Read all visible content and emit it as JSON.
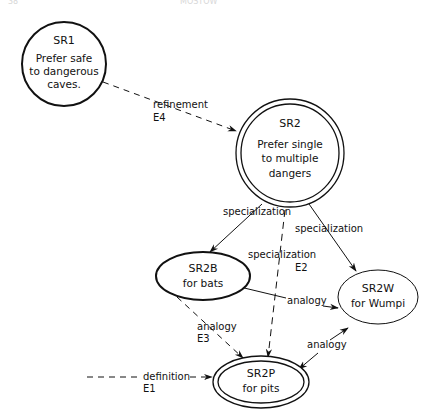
{
  "header": {
    "page_fragment": "38",
    "title_fragment": "MOSTOW"
  },
  "nodes": {
    "sr1": {
      "id": "SR1",
      "lines": [
        "Prefer safe",
        "to dangerous",
        "caves."
      ]
    },
    "sr2": {
      "id": "SR2",
      "lines": [
        "Prefer single",
        "to multiple",
        "dangers"
      ]
    },
    "sr2b": {
      "id": "SR2B",
      "lines": [
        "for bats"
      ]
    },
    "sr2w": {
      "id": "SR2W",
      "lines": [
        "for Wumpi"
      ]
    },
    "sr2p": {
      "id": "SR2P",
      "lines": [
        "for pits"
      ]
    }
  },
  "edges": {
    "sr1_sr2": {
      "label": "refinement",
      "event": "E4",
      "style": "dashed"
    },
    "sr2_sr2b": {
      "label": "specialization",
      "style": "solid"
    },
    "sr2_sr2w": {
      "label": "specialization",
      "style": "solid"
    },
    "sr2_sr2p": {
      "label": "specialization",
      "event": "E2",
      "style": "dashed"
    },
    "sr2b_sr2w": {
      "label": "analogy",
      "style": "solid-bidirectional"
    },
    "sr2b_sr2p": {
      "label": "analogy",
      "event": "E3",
      "style": "dashed"
    },
    "sr2p_sr2w": {
      "label": "analogy",
      "style": "solid-bidirectional"
    },
    "def_sr2p": {
      "label": "definition",
      "event": "E1",
      "style": "dashed"
    }
  },
  "colors": {
    "ink": "#111111",
    "background": "#ffffff"
  }
}
